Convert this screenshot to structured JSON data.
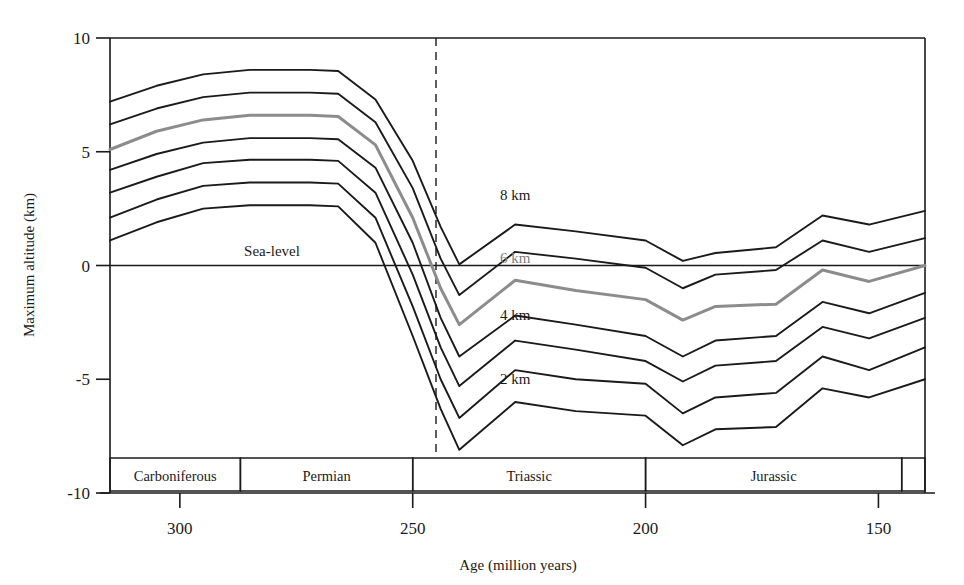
{
  "chart_data": {
    "type": "line",
    "title": "",
    "xlabel": "Age (million years)",
    "ylabel": "Maximum altitude (km)",
    "xlim": [
      315,
      140
    ],
    "ylim": [
      -10,
      10
    ],
    "x_ticks": [
      300,
      250,
      200,
      150
    ],
    "y_ticks": [
      10,
      5,
      0,
      -5,
      -10
    ],
    "x_axis_reversed": true,
    "grid": false,
    "legend": "inline-labels",
    "annotations": {
      "sea_level": "Sea-level",
      "sea_level_value": 0,
      "event_marker_age": 250,
      "event_marker_style": "dashed-vertical"
    },
    "series_labels": [
      "8 km",
      "6 km",
      "4 km",
      "2 km"
    ],
    "highlight_series": "6 km",
    "highlight_color": "#8c8c8c",
    "line_color": "#1a1a1a",
    "x": [
      315,
      305,
      295,
      285,
      272,
      266,
      258,
      250,
      244,
      240,
      228,
      215,
      200,
      192,
      185,
      172,
      162,
      152,
      140
    ],
    "series": [
      {
        "name": "8 km",
        "label": "8 km",
        "color": "#1a1a1a",
        "values": [
          7.2,
          7.9,
          8.4,
          8.6,
          8.6,
          8.55,
          7.3,
          4.6,
          1.7,
          0.05,
          1.8,
          1.5,
          1.1,
          0.2,
          0.55,
          0.8,
          2.2,
          1.8,
          2.4
        ]
      },
      {
        "name": "7 km",
        "label": "",
        "color": "#1a1a1a",
        "values": [
          6.2,
          6.9,
          7.4,
          7.6,
          7.6,
          7.55,
          6.3,
          3.4,
          0.3,
          -1.3,
          0.6,
          0.3,
          -0.1,
          -1.0,
          -0.4,
          -0.2,
          1.1,
          0.6,
          1.2
        ]
      },
      {
        "name": "6 km",
        "label": "6 km",
        "color": "#8c8c8c",
        "values": [
          5.1,
          5.9,
          6.4,
          6.6,
          6.6,
          6.55,
          5.3,
          2.1,
          -1.0,
          -2.6,
          -0.65,
          -1.1,
          -1.5,
          -2.4,
          -1.8,
          -1.7,
          -0.2,
          -0.7,
          0.0
        ]
      },
      {
        "name": "5 km",
        "label": "",
        "color": "#1a1a1a",
        "values": [
          4.2,
          4.9,
          5.4,
          5.6,
          5.6,
          5.55,
          4.3,
          1.0,
          -2.3,
          -4.0,
          -2.2,
          -2.6,
          -3.1,
          -4.0,
          -3.3,
          -3.1,
          -1.6,
          -2.1,
          -1.2
        ]
      },
      {
        "name": "4 km",
        "label": "4 km",
        "color": "#1a1a1a",
        "values": [
          3.2,
          3.9,
          4.5,
          4.65,
          4.65,
          4.6,
          3.2,
          -0.4,
          -3.6,
          -5.3,
          -3.3,
          -3.7,
          -4.2,
          -5.1,
          -4.4,
          -4.2,
          -2.7,
          -3.2,
          -2.3
        ]
      },
      {
        "name": "3 km",
        "label": "",
        "color": "#1a1a1a",
        "values": [
          2.1,
          2.9,
          3.5,
          3.65,
          3.65,
          3.6,
          2.1,
          -1.8,
          -5.0,
          -6.7,
          -4.6,
          -5.0,
          -5.2,
          -6.5,
          -5.8,
          -5.6,
          -4.0,
          -4.6,
          -3.6
        ]
      },
      {
        "name": "2 km",
        "label": "2 km",
        "color": "#1a1a1a",
        "values": [
          1.1,
          1.9,
          2.5,
          2.65,
          2.65,
          2.6,
          1.0,
          -3.1,
          -6.3,
          -8.1,
          -6.0,
          -6.4,
          -6.6,
          -7.9,
          -7.2,
          -7.1,
          -5.4,
          -5.8,
          -5.0
        ]
      }
    ],
    "curve_label_positions": [
      {
        "text": "8 km",
        "age": 228,
        "alt": 2.9,
        "gray": false
      },
      {
        "text": "6 km",
        "age": 228,
        "alt": 0.1,
        "gray": true
      },
      {
        "text": "4 km",
        "age": 228,
        "alt": -2.4,
        "gray": false
      },
      {
        "text": "2 km",
        "age": 228,
        "alt": -5.2,
        "gray": false
      }
    ],
    "periods": [
      {
        "name": "Carboniferous",
        "start": 315,
        "end": 287
      },
      {
        "name": "Permian",
        "start": 287,
        "end": 250
      },
      {
        "name": "Triassic",
        "start": 250,
        "end": 200
      },
      {
        "name": "Jurassic",
        "start": 200,
        "end": 145
      },
      {
        "name": "",
        "start": 145,
        "end": 140
      }
    ]
  },
  "axes": {
    "y_title": "Maximum altitude (km)",
    "x_title": "Age (million years)",
    "y_tick_labels": [
      "10",
      "5",
      "0",
      "-5",
      "-10"
    ],
    "x_tick_labels": [
      "300",
      "250",
      "200",
      "150"
    ]
  },
  "labels": {
    "sea_level": "Sea-level",
    "km8": "8 km",
    "km6": "6 km",
    "km4": "4 km",
    "km2": "2 km"
  },
  "periods": {
    "carboniferous": "Carboniferous",
    "permian": "Permian",
    "triassic": "Triassic",
    "jurassic": "Jurassic"
  },
  "colors": {
    "line": "#1a1a1a",
    "highlight": "#8c8c8c",
    "background": "#ffffff"
  }
}
